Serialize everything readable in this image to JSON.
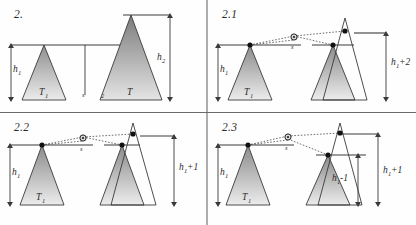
{
  "figure": {
    "type": "geometric-diagram-grid",
    "rows": 2,
    "cols": 2,
    "background": "#fefefe",
    "line_color": "#3a3a3a",
    "divider_color": "#6a6a6a",
    "triangle_fill_top": "#8e8e8e",
    "triangle_fill_bottom": "#e8e8e8",
    "marker_color": "#1a1a1a"
  },
  "panels": [
    {
      "id": "panel-2",
      "label": "2.",
      "labels": {
        "h_left": "h",
        "h_left_sub": "1",
        "h_right": "h",
        "h_right_sub": "2",
        "tri_left": "T",
        "tri_left_sub": "1",
        "tri_right": "T",
        "site": "s",
        "site_right": "2"
      }
    },
    {
      "id": "panel-2-1",
      "label": "2.1",
      "labels": {
        "h_left": "h",
        "h_left_sub": "1",
        "tri_left": "T",
        "tri_left_sub": "1",
        "site": "s",
        "dim_right": "h",
        "dim_right_sub": "1",
        "dim_right_tail": "+2"
      }
    },
    {
      "id": "panel-2-2",
      "label": "2.2",
      "labels": {
        "h_left": "h",
        "h_left_sub": "1",
        "tri_left": "T",
        "tri_left_sub": "1",
        "site": "s",
        "dim_right": "h",
        "dim_right_sub": "1",
        "dim_right_tail": "+1"
      }
    },
    {
      "id": "panel-2-3",
      "label": "2.3",
      "labels": {
        "h_left": "h",
        "h_left_sub": "1",
        "tri_left": "T",
        "tri_left_sub": "1",
        "site": "s",
        "dim_inner": "h",
        "dim_inner_sub": "1",
        "dim_inner_tail": "-1",
        "dim_outer": "h",
        "dim_outer_sub": "1",
        "dim_outer_tail": "+1"
      }
    }
  ]
}
